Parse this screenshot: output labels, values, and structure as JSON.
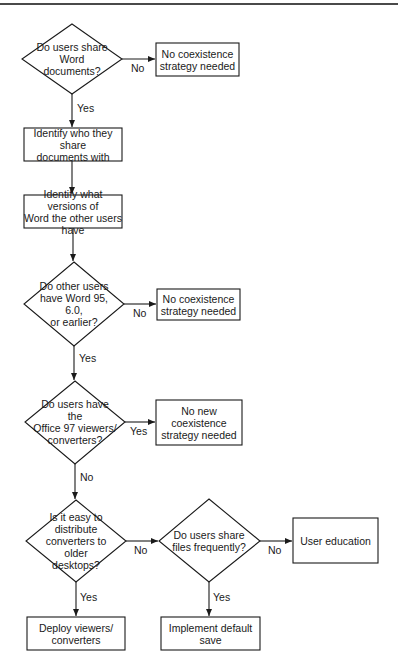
{
  "diagram": {
    "type": "flowchart",
    "nodes": {
      "q_share_docs": {
        "shape": "diamond",
        "label": "Do users share\nWord documents?"
      },
      "r_no_strategy_1": {
        "shape": "rect",
        "label": "No coexistence\nstrategy needed"
      },
      "s_identify_who": {
        "shape": "rect",
        "label": "Identify who they share\ndocuments with"
      },
      "s_identify_versions": {
        "shape": "rect",
        "label": "Identify what versions of\nWord the other users have"
      },
      "q_older_versions": {
        "shape": "diamond",
        "label": "Do other users\nhave Word 95, 6.0,\nor earlier?"
      },
      "r_no_strategy_2": {
        "shape": "rect",
        "label": "No coexistence\nstrategy needed"
      },
      "q_viewers": {
        "shape": "diamond",
        "label": "Do users have the\nOffice 97 viewers/\nconverters?"
      },
      "r_no_new_strategy": {
        "shape": "rect",
        "label": "No new\ncoexistence\nstrategy needed"
      },
      "q_easy_distribute": {
        "shape": "diamond",
        "label": "Is it easy to\ndistribute\nconverters to older\ndesktops?"
      },
      "q_share_frequently": {
        "shape": "diamond",
        "label": "Do users share\nfiles frequently?"
      },
      "r_user_education": {
        "shape": "rect",
        "label": "User education"
      },
      "r_deploy": {
        "shape": "rect",
        "label": "Deploy viewers/\nconverters"
      },
      "r_default_save": {
        "shape": "rect",
        "label": "Implement default save"
      }
    },
    "edges": [
      {
        "from": "q_share_docs",
        "to": "r_no_strategy_1",
        "label": "No"
      },
      {
        "from": "q_share_docs",
        "to": "s_identify_who",
        "label": "Yes"
      },
      {
        "from": "s_identify_who",
        "to": "s_identify_versions",
        "label": ""
      },
      {
        "from": "s_identify_versions",
        "to": "q_older_versions",
        "label": ""
      },
      {
        "from": "q_older_versions",
        "to": "r_no_strategy_2",
        "label": "No"
      },
      {
        "from": "q_older_versions",
        "to": "q_viewers",
        "label": "Yes"
      },
      {
        "from": "q_viewers",
        "to": "r_no_new_strategy",
        "label": "Yes"
      },
      {
        "from": "q_viewers",
        "to": "q_easy_distribute",
        "label": "No"
      },
      {
        "from": "q_easy_distribute",
        "to": "q_share_frequently",
        "label": "No"
      },
      {
        "from": "q_easy_distribute",
        "to": "r_deploy",
        "label": "Yes"
      },
      {
        "from": "q_share_frequently",
        "to": "r_user_education",
        "label": "No"
      },
      {
        "from": "q_share_frequently",
        "to": "r_default_save",
        "label": "Yes"
      }
    ],
    "edge_labels": {
      "e1_no": "No",
      "e2_yes": "Yes",
      "e5_no": "No",
      "e6_yes": "Yes",
      "e7_yes": "Yes",
      "e8_no": "No",
      "e9_no": "No",
      "e10_yes": "Yes",
      "e11_no": "No",
      "e12_yes": "Yes"
    },
    "colors": {
      "stroke": "#1a1a1a",
      "background": "#ffffff",
      "rule": "#4a4a4a"
    }
  }
}
